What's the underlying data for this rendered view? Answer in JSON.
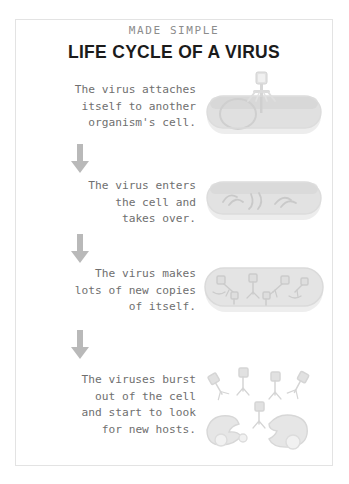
{
  "poster": {
    "kicker": "MADE SIMPLE",
    "title": "LIFE CYCLE OF A VIRUS",
    "background_color": "#ffffff",
    "frame_color": "#e3e3e3",
    "text_color": "#6f6f6f",
    "title_color": "#1b1b1b",
    "art_color": "#d8d8d8",
    "arrow_color": "#b9b9b9"
  },
  "stages": [
    {
      "index": 1,
      "text": "The virus attaches\nitself to another\norganism's cell.",
      "art_name": "virus-attaching-to-cell-illustration",
      "art_description": "bacteriophage landing on top of a rod-shaped bacterial cell"
    },
    {
      "index": 2,
      "text": "The virus enters\nthe cell and\ntakes over.",
      "art_name": "virus-dna-inside-cell-illustration",
      "art_description": "bacterial cell containing loose viral DNA strands"
    },
    {
      "index": 3,
      "text": "The virus makes\nlots of new copies\nof itself.",
      "art_name": "virus-replication-inside-cell-illustration",
      "art_description": "bacterial cell packed with many newly assembled virus particles"
    },
    {
      "index": 4,
      "text": "The viruses burst\nout of the cell\nand start to look\nfor new hosts.",
      "art_name": "cell-lysis-viruses-released-illustration",
      "art_description": "ruptured cell fragments with many phages scattering outward"
    }
  ],
  "arrows": [
    {
      "name": "arrow-stage-1-to-2",
      "direction": "down"
    },
    {
      "name": "arrow-stage-2-to-3",
      "direction": "down"
    },
    {
      "name": "arrow-stage-3-to-4",
      "direction": "down"
    }
  ]
}
